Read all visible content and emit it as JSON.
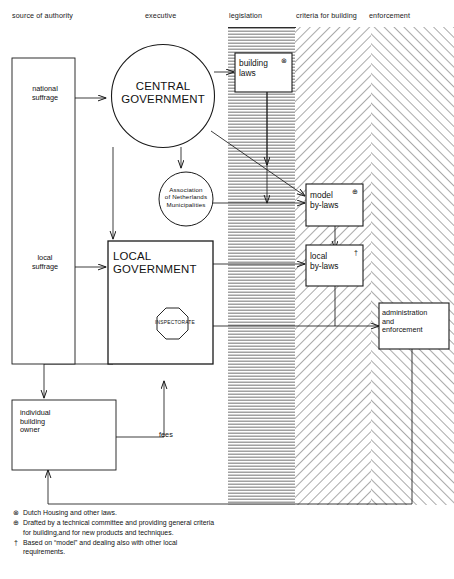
{
  "diagram": {
    "columns": [
      {
        "id": "source-of-authority",
        "label": "source of authority"
      },
      {
        "id": "executive",
        "label": "executive"
      },
      {
        "id": "legislation",
        "label": "legislation"
      },
      {
        "id": "criteria-for-building",
        "label": "criteria for building"
      },
      {
        "id": "enforcement",
        "label": "enforcement"
      }
    ],
    "nodes": {
      "national_suffrage": "national\nsuffrage",
      "local_suffrage": "local\nsuffrage",
      "central_government": "CENTRAL\nGOVERNMENT",
      "association": "Association\nof Netherlands\nMunicipalities",
      "local_government": "LOCAL\nGOVERNMENT",
      "inspectorate": "INSPECTORATE",
      "individual_building_owner": "individual\nbuilding\nowner",
      "building_laws": "building\nlaws",
      "model_by_laws": "model\nby-laws",
      "local_by_laws": "local\nby-laws",
      "administration_and_enforcement": "administration\nand\nenforcement"
    },
    "edge_labels": {
      "fees": "fees"
    },
    "markers": {
      "building_laws": "⊗",
      "model_by_laws": "⊕",
      "local_by_laws": "†"
    },
    "notes": [
      {
        "symbol": "⊗",
        "text": "Dutch Housing and other laws."
      },
      {
        "symbol": "⊕",
        "text": "Drafted by a technical committee and providing general criteria\nfor building,and for new products and techniques."
      },
      {
        "symbol": "†",
        "text": "Based on “model” and dealing also with other local\nrequirements."
      }
    ],
    "colors": {
      "stroke": "#1a1a1a",
      "hatch": "#8a8a8a",
      "background": "#ffffff"
    }
  }
}
